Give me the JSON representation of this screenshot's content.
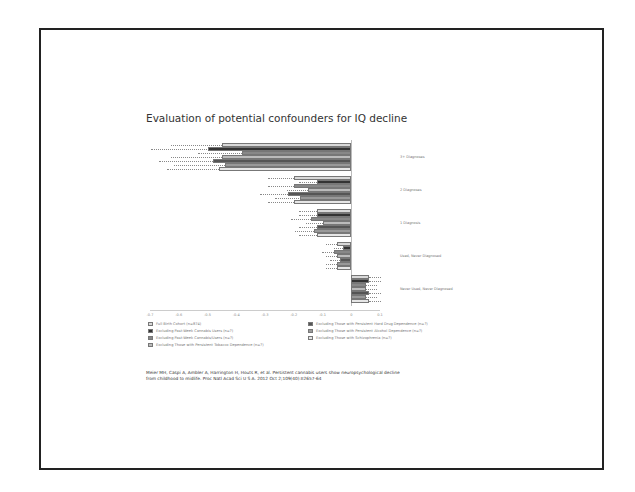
{
  "slide": {
    "title": "Evaluation of potential confounders for IQ decline",
    "citation": "Meier MH, Caspi A, Ambler A, Harrington H, Houts R, et al. Persistent cannabis users show neuropsychological decline from childhood to midlife. Proc Natl Acad Sci U S A. 2012 Oct 2;109(40):E2657-64"
  },
  "chart_data": {
    "type": "bar",
    "orientation": "horizontal",
    "title": "Evaluation of potential confounders for IQ decline",
    "xlabel": "",
    "ylabel": "",
    "xlim": [
      -0.7,
      0.1
    ],
    "x_ticks": [
      "-0.7",
      "-0.6",
      "-0.5",
      "-0.4",
      "-0.3",
      "-0.2",
      "-0.1",
      "0",
      "0.1"
    ],
    "grid": false,
    "legend_position": "bottom",
    "categories": [
      "3+ Diagnoses",
      "2 Diagnoses",
      "1 Diagnosis",
      "Used, Never Diagnosed",
      "Never Used, Never Diagnosed"
    ],
    "series": [
      {
        "name": "Full Birth Cohort (n=874)",
        "color": "#d9d9d9",
        "values": [
          -0.45,
          -0.2,
          -0.12,
          -0.05,
          0.06
        ]
      },
      {
        "name": "Excluding Past-Week Cannabis Users (n=?)",
        "color": "#333333",
        "values": [
          -0.5,
          -0.12,
          -0.12,
          -0.03,
          0.06
        ]
      },
      {
        "name": "Excluding Past-Week Cannabis/Users (n=?)",
        "color": "#888888",
        "values": [
          -0.38,
          -0.2,
          -0.14,
          -0.06,
          0.05
        ]
      },
      {
        "name": "Excluding Those with Persistent Tobacco Dependence (n=?)",
        "color": "#bbbbbb",
        "values": [
          -0.45,
          -0.15,
          -0.1,
          -0.05,
          0.05
        ]
      },
      {
        "name": "Excluding Those with Persistent Hard Drug Dependence (n=?)",
        "color": "#555555",
        "values": [
          -0.48,
          -0.22,
          -0.12,
          -0.04,
          0.06
        ]
      },
      {
        "name": "Excluding Those with Persistent Alcohol Dependence (n=?)",
        "color": "#999999",
        "values": [
          -0.44,
          -0.18,
          -0.13,
          -0.05,
          0.05
        ]
      },
      {
        "name": "Excluding Those with Schizophrenia (n=?)",
        "color": "#e6e6e6",
        "values": [
          -0.46,
          -0.2,
          -0.12,
          -0.05,
          0.06
        ]
      }
    ]
  },
  "legend": {
    "left": [
      "Full Birth Cohort (n=874)",
      "Excluding Past-Week Cannabis Users (n=?)",
      "Excluding Past-Week Cannabis/Users (n=?)",
      "Excluding Those with Persistent Tobacco Dependence (n=?)"
    ],
    "right": [
      "Excluding Those with Persistent Hard Drug Dependence (n=?)",
      "Excluding Those with Persistent Alcohol Dependence (n=?)",
      "Excluding Those with Schizophrenia (n=?)"
    ]
  }
}
